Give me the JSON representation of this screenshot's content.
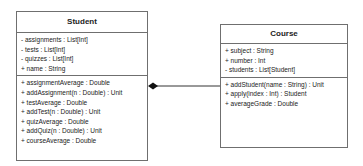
{
  "classes": {
    "student": {
      "name": "Student",
      "attributes": [
        "- assignments : List[Int]",
        "- tests : List[Int]",
        "- quizzes : List[Int]",
        "+ name : String"
      ],
      "methods": [
        "+ assignmentAverage : Double",
        "+ addAssignment(n : Double) : Unit",
        "+ testAverage : Double",
        "+ addTest(n : Double) : Unit",
        "+ quizAverage : Double",
        "+ addQuiz(n : Double) : Unit",
        "+ courseAverage : Double"
      ]
    },
    "course": {
      "name": "Course",
      "attributes": [
        "+ subject : String",
        "+ number : Int",
        "- students : List[Student]"
      ],
      "methods": [
        "+ addStudent(name : String) : Unit",
        "+ apply(index : Int) : Student",
        "+ averageGrade : Double"
      ]
    }
  },
  "relationships": [
    {
      "type": "composition",
      "whole": "Student",
      "part": "Course",
      "diamond_end": "Student"
    }
  ]
}
